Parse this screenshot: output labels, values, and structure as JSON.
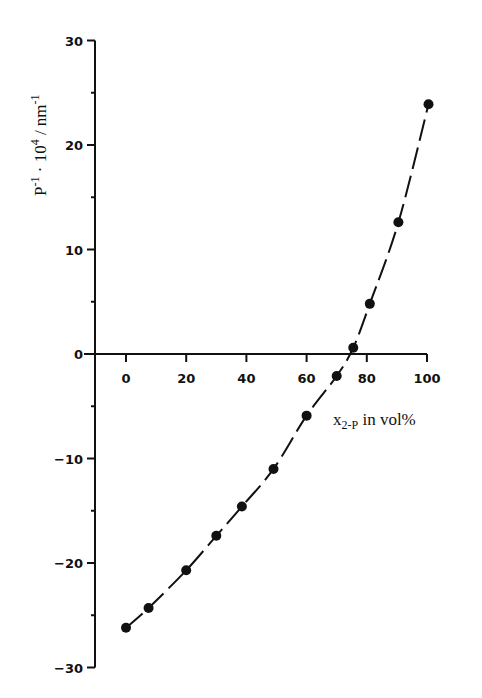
{
  "chart_data": {
    "type": "scatter",
    "title": "",
    "xlabel": "x2-P in vol%",
    "xlabel_main": "x",
    "xlabel_sub": "2-P",
    "xlabel_rest": " in vol%",
    "ylabel": "P^-1 · 10^4 / nm^-1",
    "ylabel_parts": {
      "p": "P",
      "p_sup": "-1",
      "dot": " · 10",
      "ten_sup": "4",
      "unit": " / nm",
      "unit_sup": "-1"
    },
    "xlim": [
      0,
      100
    ],
    "ylim": [
      -30,
      30
    ],
    "x_ticks": [
      0,
      20,
      40,
      60,
      80,
      100
    ],
    "x_tick_labels": [
      "0",
      "20",
      "40",
      "60",
      "80",
      "100"
    ],
    "y_ticks": [
      30,
      20,
      10,
      0,
      -10,
      -20,
      -30
    ],
    "y_tick_labels": [
      "30",
      "20",
      "10",
      "0",
      "-10",
      "-20",
      "-30"
    ],
    "y_minor_ticks": [
      25,
      15,
      5,
      -5,
      -15,
      -25
    ],
    "grid": false,
    "legend": null,
    "series": [
      {
        "name": "measured",
        "marker": "filled-circle",
        "line": "dashed-fit",
        "color": "#111111",
        "points": [
          {
            "x": 0,
            "y": -26.2
          },
          {
            "x": 7.5,
            "y": -24.3
          },
          {
            "x": 20,
            "y": -20.7
          },
          {
            "x": 30,
            "y": -17.4
          },
          {
            "x": 38.5,
            "y": -14.6
          },
          {
            "x": 49,
            "y": -11.0
          },
          {
            "x": 60,
            "y": -5.9
          },
          {
            "x": 70,
            "y": -2.1
          },
          {
            "x": 75.5,
            "y": 0.6
          },
          {
            "x": 81,
            "y": 4.8
          },
          {
            "x": 90.5,
            "y": 12.6
          },
          {
            "x": 100.5,
            "y": 23.9
          }
        ]
      }
    ]
  }
}
